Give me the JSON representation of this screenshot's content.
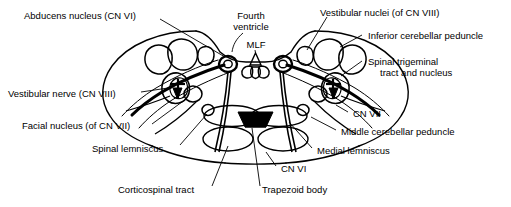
{
  "figure": {
    "kind": "anatomical-cross-section",
    "stroke_color": "#000000",
    "fill_color": "#ffffff",
    "labels": {
      "abducens_nucleus": "Abducens nucleus (CN VI)",
      "fourth_ventricle_line1": "Fourth",
      "fourth_ventricle_line2": "ventricle",
      "mlf": "MLF",
      "vestibular_nuclei": "Vestibular nuclei (of CN VIII)",
      "inferior_cerebellar_peduncle": "Inferior cerebellar peduncle",
      "spinal_trigeminal_line1": "Spinal trigeminal",
      "spinal_trigeminal_line2": "tract and nucleus",
      "vestibular_nerve": "Vestibular nerve (CN VIII)",
      "facial_nucleus": "Facial nucleus (of CN VII)",
      "spinal_lemniscus": "Spinal lemniscus",
      "corticospinal_tract": "Corticospinal tract",
      "trapezoid_body": "Trapezoid body",
      "cn_vi": "CN VI",
      "cn_vii": "CN VII",
      "medial_lemniscus": "Medial lemniscus",
      "middle_cerebellar_peduncle": "Middle cerebellar peduncle"
    },
    "label_positions": {
      "abducens_nucleus": {
        "x": 24,
        "y": 10
      },
      "fourth_ventricle": {
        "x": 222,
        "y": 10
      },
      "mlf": {
        "x": 240,
        "y": 41
      },
      "vestibular_nuclei": {
        "x": 320,
        "y": 7
      },
      "inferior_cerebellar_peduncle": {
        "x": 366,
        "y": 31
      },
      "spinal_trigeminal": {
        "x": 366,
        "y": 57
      },
      "vestibular_nerve": {
        "x": 8,
        "y": 89
      },
      "facial_nucleus": {
        "x": 22,
        "y": 122
      },
      "spinal_lemniscus": {
        "x": 92,
        "y": 145
      },
      "corticospinal_tract": {
        "x": 118,
        "y": 186
      },
      "trapezoid_body": {
        "x": 262,
        "y": 186
      },
      "cn_vi": {
        "x": 280,
        "y": 165
      },
      "cn_vii": {
        "x": 352,
        "y": 110
      },
      "medial_lemniscus": {
        "x": 316,
        "y": 147
      },
      "middle_cerebellar_peduncle": {
        "x": 340,
        "y": 128
      }
    }
  }
}
